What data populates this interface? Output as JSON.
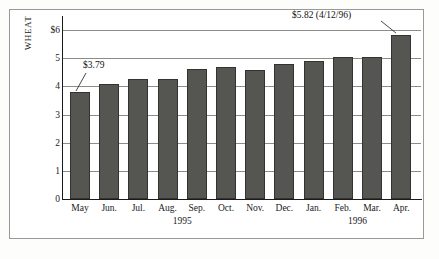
{
  "chart_data": {
    "type": "bar",
    "title": "",
    "subtitle": "",
    "xlabel": "",
    "ylabel": "WHEAT",
    "ylim": [
      0,
      6
    ],
    "grid": true,
    "legend": false,
    "categories": [
      "May",
      "Jun.",
      "Jul.",
      "Aug.",
      "Sep.",
      "Oct.",
      "Nov.",
      "Dec.",
      "Jan.",
      "Feb.",
      "Mar.",
      "Apr."
    ],
    "values": [
      3.79,
      4.1,
      4.27,
      4.26,
      4.62,
      4.67,
      4.59,
      4.8,
      4.9,
      5.03,
      5.03,
      5.82
    ],
    "ytick_labels": [
      "$6",
      "5",
      "4",
      "3",
      "2",
      "1",
      "0"
    ],
    "ytick_values": [
      6,
      5,
      4,
      3,
      2,
      1,
      0
    ],
    "year_groups": [
      {
        "label": "1995",
        "start_index": 0,
        "end_index": 7
      },
      {
        "label": "1996",
        "start_index": 8,
        "end_index": 11
      }
    ],
    "annotations": [
      {
        "name": "first-bar-callout",
        "text": "$3.79",
        "target_index": 0
      },
      {
        "name": "last-bar-callout",
        "text": "$5.82 (4/12/96)",
        "target_index": 11
      }
    ],
    "colors": {
      "bar_fill": "#555552",
      "bar_edge": "#33332f",
      "gridline": "#8d8d88",
      "axis": "#1a1a1a",
      "text": "#111111",
      "frame": "#9a9a95",
      "background": "#ffffff"
    }
  }
}
